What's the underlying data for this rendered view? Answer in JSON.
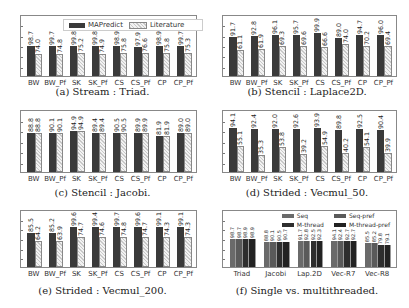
{
  "legend": {
    "a": "MAPredict",
    "b": "Literature"
  },
  "categories": [
    "BW",
    "BW_Pf",
    "SK",
    "SK_Pf",
    "CS",
    "CS_Pf",
    "CP",
    "CP_Pf"
  ],
  "captions": {
    "a": "(a) Stream : Triad.",
    "b": "(b) Stencil : Laplace2D.",
    "c": "(c) Stencil : Jacobi.",
    "d": "(d) Strided : Vecmul_50.",
    "e": "(e) Strided : Vecmul_200.",
    "f": "(f) Single vs. multithreaded."
  },
  "chart_data": [
    {
      "type": "bar",
      "title": "(a) Stream : Triad.",
      "categories": [
        "BW",
        "BW_Pf",
        "SK",
        "SK_Pf",
        "CS",
        "CS_Pf",
        "CP",
        "CP_Pf"
      ],
      "series": [
        {
          "name": "MAPredict",
          "values": [
            98.7,
            99.7,
            99.8,
            99.8,
            98.9,
            97.9,
            98.9,
            99.7
          ]
        },
        {
          "name": "Literature",
          "values": [
            74.0,
            74.8,
            75.2,
            74.9,
            75.8,
            76.6,
            75.8,
            75.3
          ]
        }
      ],
      "ylim": [
        0,
        200
      ],
      "legend_position": "top"
    },
    {
      "type": "bar",
      "title": "(b) Stencil : Laplace2D.",
      "categories": [
        "BW",
        "BW_Pf",
        "SK",
        "SK_Pf",
        "CS",
        "CS_Pf",
        "CP",
        "CP_Pf"
      ],
      "series": [
        {
          "name": "MAPredict",
          "values": [
            91.7,
            92.8,
            96.1,
            95.7,
            99.9,
            89.0,
            94.7,
            96.0
          ]
        },
        {
          "name": "Literature",
          "values": [
            61.1,
            61.9,
            69.3,
            69.6,
            66.6,
            74.0,
            70.2,
            69.4
          ]
        }
      ],
      "ylim": [
        0,
        140
      ]
    },
    {
      "type": "bar",
      "title": "(c) Stencil : Jacobi.",
      "categories": [
        "BW",
        "BW_Pf",
        "SK",
        "SK_Pf",
        "CS",
        "CS_Pf",
        "CP",
        "CP_Pf"
      ],
      "series": [
        {
          "name": "MAPredict",
          "values": [
            88.8,
            90.1,
            94.9,
            89.4,
            90.5,
            89.9,
            81.9,
            89.0
          ]
        },
        {
          "name": "Literature",
          "values": [
            88.8,
            90.1,
            94.9,
            89.4,
            90.5,
            89.9,
            81.9,
            89.0
          ]
        }
      ],
      "ylim": [
        0,
        140
      ]
    },
    {
      "type": "bar",
      "title": "(d) Strided : Vecmul_50.",
      "categories": [
        "BW",
        "BW_Pf",
        "SK",
        "SK_Pf",
        "CS",
        "CS_Pf",
        "CP",
        "CP_Pf"
      ],
      "series": [
        {
          "name": "MAPredict",
          "values": [
            94.1,
            92.4,
            92.0,
            92.6,
            93.9,
            89.8,
            92.5,
            90.4
          ]
        },
        {
          "name": "Literature",
          "values": [
            55.1,
            35.3,
            53.8,
            39.2,
            54.9,
            40.2,
            54.1,
            39.9
          ]
        }
      ],
      "ylim": [
        0,
        130
      ]
    },
    {
      "type": "bar",
      "title": "(e) Strided : Vecmul_200.",
      "categories": [
        "BW",
        "BW_Pf",
        "SK",
        "SK_Pf",
        "CS",
        "CS_Pf",
        "CP",
        "CP_Pf"
      ],
      "series": [
        {
          "name": "MAPredict",
          "values": [
            85.5,
            85.2,
            99.6,
            99.4,
            99.7,
            99.6,
            99.1,
            99.1
          ]
        },
        {
          "name": "Literature",
          "values": [
            64.2,
            63.9,
            74.7,
            74.6,
            74.8,
            74.7,
            74.3,
            74.3
          ]
        }
      ],
      "ylim": [
        0,
        140
      ]
    },
    {
      "type": "bar",
      "title": "(f) Single vs. multithreaded.",
      "categories": [
        "Triad",
        "Jacobi",
        "Lap.2D",
        "Vec-R7",
        "Vec-R8"
      ],
      "series": [
        {
          "name": "Seq",
          "values": [
            98.7,
            88.8,
            91.7,
            94.1,
            85.5
          ]
        },
        {
          "name": "Seq-pref",
          "values": [
            98.7,
            90.1,
            92.8,
            92.4,
            85.2
          ]
        },
        {
          "name": "M-thread",
          "values": [
            98.9,
            90.5,
            92.5,
            92.7,
            79.8
          ]
        },
        {
          "name": "M-thread-pref",
          "values": [
            98.9,
            90.7,
            92.3,
            92.7,
            79.1
          ]
        }
      ],
      "ylim": [
        0,
        200
      ],
      "legend_position": "top-right"
    }
  ]
}
